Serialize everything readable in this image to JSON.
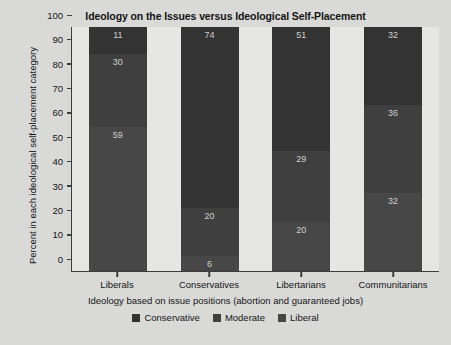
{
  "chart_data": {
    "type": "bar",
    "subtype": "stacked-percent",
    "title": "Ideology on the Issues versus Ideological Self-Placement",
    "xlabel": "Ideology based on issue positions (abortion and guaranteed jobs)",
    "ylabel": "Percent in each ideological self-placement category",
    "categories": [
      "Liberals",
      "Conservatives",
      "Libertarians",
      "Communitarians"
    ],
    "series": [
      {
        "name": "Conservative",
        "color": "#333333",
        "values": [
          11,
          74,
          51,
          32
        ]
      },
      {
        "name": "Moderate",
        "color": "#3f3f3f",
        "values": [
          30,
          20,
          29,
          36
        ]
      },
      {
        "name": "Liberal",
        "color": "#474747",
        "values": [
          59,
          6,
          20,
          32
        ]
      }
    ],
    "ylim": [
      0,
      100
    ],
    "yticks": [
      100,
      90,
      80,
      70,
      60,
      50,
      40,
      30,
      20,
      10,
      0
    ],
    "grid": false,
    "legend_position": "bottom",
    "stack_order_top_to_bottom": [
      "Conservative",
      "Moderate",
      "Liberal"
    ]
  },
  "colors": {
    "figure_background": "#d9d9d7",
    "plot_background": "#e6e6e4",
    "axis": "#3c3c3c",
    "text": "#151515",
    "value_label": "#cfcfcf"
  }
}
